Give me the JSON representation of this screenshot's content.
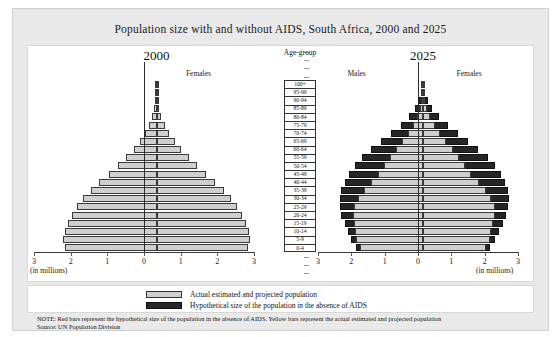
{
  "title": "Population size with and without AIDS, South Africa, 2000 and 2025",
  "age_header": "Age-group",
  "axis": {
    "units": "(in millions)",
    "ticks": [
      "3",
      "2",
      "1",
      "0",
      "1",
      "2",
      "3"
    ],
    "min": -3,
    "max": 3
  },
  "legend": {
    "actual": "Actual estimated and projected population",
    "hypothetical": "Hypothetical size of the population in the absence of AIDS"
  },
  "note": "NOTE: Red bars represent the hypothetical size of the population in the absence of AIDS. Yellow bars represent the actual estimated and projected population",
  "source": "Source: UN Population Division",
  "panel_2000": {
    "year": "2000",
    "females_label": "Females",
    "males_label": ""
  },
  "panel_2025": {
    "year": "2025",
    "females_label": "Females",
    "males_label": "Males"
  },
  "chart_data": {
    "type": "bar",
    "subtype": "population-pyramid",
    "title": "Population size with and without AIDS, South Africa, 2000 and 2025",
    "xlabel": "(in millions)",
    "ylabel": "Age-group",
    "xlim": [
      -3,
      3
    ],
    "xticks": [
      3,
      2,
      1,
      0,
      1,
      2,
      3
    ],
    "grid": false,
    "legend_position": "bottom",
    "colors": {
      "actual": "#cfcfcf",
      "hypothetical": "#262626"
    },
    "categories": [
      "100+",
      "95-99",
      "90-94",
      "85-89",
      "80-84",
      "75-79",
      "70-74",
      "65-69",
      "60-64",
      "55-59",
      "50-54",
      "45-49",
      "40-44",
      "35-39",
      "30-34",
      "25-29",
      "20-24",
      "15-19",
      "10-14",
      "5-9",
      "0-4"
    ],
    "panels": [
      {
        "name": "2000",
        "series": [
          {
            "name": "Actual estimated and projected population",
            "males": [
              0.004,
              0.012,
              0.03,
              0.06,
              0.11,
              0.2,
              0.31,
              0.45,
              0.62,
              0.82,
              1.05,
              1.3,
              1.56,
              1.8,
              2.0,
              2.18,
              2.3,
              2.42,
              2.5,
              2.55,
              2.5
            ],
            "females": [
              0.006,
              0.016,
              0.038,
              0.075,
              0.135,
              0.23,
              0.35,
              0.5,
              0.68,
              0.88,
              1.1,
              1.35,
              1.6,
              1.85,
              2.04,
              2.2,
              2.32,
              2.44,
              2.52,
              2.56,
              2.5
            ]
          }
        ]
      },
      {
        "name": "2025",
        "series": [
          {
            "name": "Actual estimated and projected population",
            "males": [
              0.01,
              0.02,
              0.05,
              0.1,
              0.18,
              0.3,
              0.45,
              0.62,
              0.82,
              1.0,
              1.18,
              1.35,
              1.55,
              1.78,
              1.95,
              2.08,
              2.1,
              2.08,
              2.05,
              2.0,
              1.9
            ],
            "females": [
              0.012,
              0.025,
              0.06,
              0.12,
              0.22,
              0.36,
              0.52,
              0.7,
              0.9,
              1.08,
              1.26,
              1.45,
              1.68,
              1.9,
              2.05,
              2.15,
              2.15,
              2.1,
              2.05,
              2.0,
              1.9
            ]
          },
          {
            "name": "Hypothetical size of the population in the absence of AIDS",
            "males": [
              0.02,
              0.05,
              0.12,
              0.24,
              0.42,
              0.66,
              0.95,
              1.25,
              1.55,
              1.82,
              2.05,
              2.22,
              2.35,
              2.45,
              2.5,
              2.5,
              2.45,
              2.35,
              2.25,
              2.15,
              2.0
            ],
            "females": [
              0.025,
              0.06,
              0.14,
              0.28,
              0.48,
              0.74,
              1.05,
              1.36,
              1.66,
              1.94,
              2.16,
              2.33,
              2.45,
              2.54,
              2.58,
              2.56,
              2.5,
              2.4,
              2.28,
              2.16,
              2.0
            ]
          }
        ]
      }
    ]
  }
}
